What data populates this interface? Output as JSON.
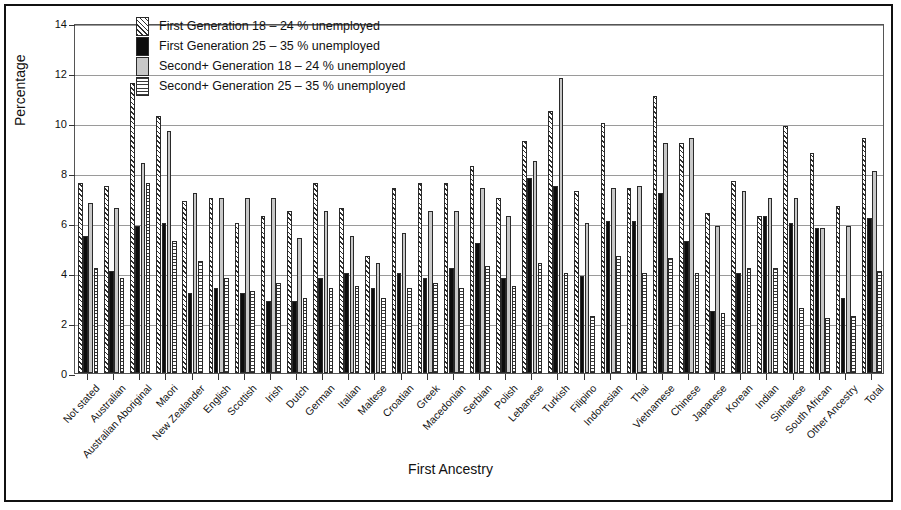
{
  "figure": {
    "y_axis_title": "Percentage",
    "x_axis_title": "First Ancestry"
  },
  "legend": {
    "items": [
      {
        "label": "First Generation 18 – 24 % unemployed",
        "swatch": "diagonal-hatch"
      },
      {
        "label": "First Generation 25 – 35 % unemployed",
        "swatch": "solid-black"
      },
      {
        "label": "Second+ Generation 18 – 24 % unemployed",
        "swatch": "solid-grey"
      },
      {
        "label": "Second+ Generation 25 – 35 % unemployed",
        "swatch": "horizontal-hatch"
      }
    ]
  },
  "chart_data": {
    "type": "bar",
    "title": "",
    "xlabel": "First Ancestry",
    "ylabel": "Percentage",
    "ylim": [
      0,
      14
    ],
    "yticks": [
      0,
      2,
      4,
      6,
      8,
      10,
      12,
      14
    ],
    "grid": true,
    "legend_position": "top-left-inside",
    "categories": [
      "Not stated",
      "Australian",
      "Australian Aboriginal",
      "Maori",
      "New Zealander",
      "English",
      "Scottish",
      "Irish",
      "Dutch",
      "German",
      "Italian",
      "Maltese",
      "Croatian",
      "Greek",
      "Macedonian",
      "Serbian",
      "Polish",
      "Lebanese",
      "Turkish",
      "Filipino",
      "Indonesian",
      "Thai",
      "Vietnamese",
      "Chinese",
      "Japanese",
      "Korean",
      "Indian",
      "Sinhalese",
      "South African",
      "Other Ancestry",
      "Total"
    ],
    "series": [
      {
        "name": "First Generation 18 – 24 % unemployed",
        "values": [
          7.6,
          7.5,
          11.6,
          10.3,
          6.9,
          7.0,
          6.0,
          6.3,
          6.5,
          7.6,
          6.6,
          4.7,
          7.4,
          7.6,
          7.6,
          8.3,
          7.0,
          9.3,
          10.5,
          7.3,
          10.0,
          7.4,
          11.1,
          9.2,
          6.4,
          7.7,
          6.3,
          9.9,
          8.8,
          6.7,
          9.4
        ]
      },
      {
        "name": "First Generation 25 – 35 % unemployed",
        "values": [
          5.5,
          4.1,
          5.9,
          6.0,
          3.2,
          3.4,
          3.2,
          2.9,
          2.9,
          3.8,
          4.0,
          3.4,
          4.0,
          3.8,
          4.2,
          5.2,
          3.8,
          7.8,
          7.5,
          3.9,
          6.1,
          6.1,
          7.2,
          5.3,
          2.5,
          4.0,
          6.3,
          6.0,
          5.8,
          3.0,
          6.2
        ]
      },
      {
        "name": "Second+ Generation 18 – 24 % unemployed",
        "values": [
          6.8,
          6.6,
          8.4,
          9.7,
          7.2,
          7.0,
          7.0,
          7.0,
          5.4,
          6.5,
          5.5,
          4.4,
          5.6,
          6.5,
          6.5,
          7.4,
          6.3,
          8.5,
          11.8,
          6.0,
          7.4,
          7.5,
          9.2,
          9.4,
          5.9,
          7.3,
          7.0,
          7.0,
          5.8,
          5.9,
          8.1
        ]
      },
      {
        "name": "Second+ Generation 25 – 35 % unemployed",
        "values": [
          4.2,
          3.8,
          7.6,
          5.3,
          4.5,
          3.8,
          3.3,
          3.6,
          3.0,
          3.4,
          3.5,
          3.0,
          3.4,
          3.6,
          3.4,
          4.3,
          3.5,
          4.4,
          4.0,
          2.3,
          4.7,
          4.0,
          4.6,
          4.0,
          2.4,
          4.2,
          4.2,
          2.6,
          2.2,
          2.3,
          4.1
        ]
      }
    ],
    "total_row": {
      "category": "Total",
      "values": [
        8.6,
        5.0,
        6.9,
        3.8
      ]
    }
  }
}
